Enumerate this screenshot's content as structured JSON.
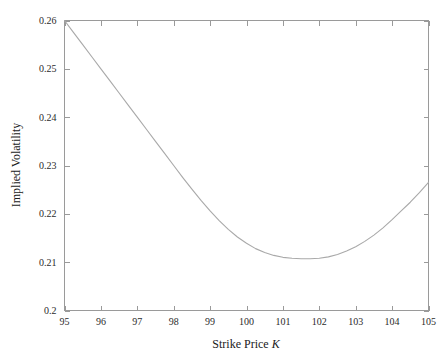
{
  "chart_data": {
    "type": "line",
    "title": "",
    "xlabel": "Strike Price K",
    "xlabel_plain": "Strike Price",
    "xlabel_symbol": "K",
    "ylabel": "Implied Volatility",
    "xlim": [
      95,
      105
    ],
    "ylim": [
      0.2,
      0.26
    ],
    "grid": false,
    "legend": null,
    "line_color": "#a9a9a9",
    "axis_color": "#9a9a9a",
    "text_color": "#2b2b2b",
    "background_color": "#ffffff",
    "xticks": [
      95,
      96,
      97,
      98,
      99,
      100,
      101,
      102,
      103,
      104,
      105
    ],
    "xtick_labels": [
      "95",
      "96",
      "97",
      "98",
      "99",
      "100",
      "101",
      "102",
      "103",
      "104",
      "105"
    ],
    "yticks": [
      0.2,
      0.21,
      0.22,
      0.23,
      0.24,
      0.25,
      0.26
    ],
    "ytick_labels": [
      "0.2",
      "0.21",
      "0.22",
      "0.23",
      "0.24",
      "0.25",
      "0.26"
    ],
    "minimum_point": {
      "x": 102.0,
      "y": 0.2108
    },
    "series": [
      {
        "name": "Implied Volatility Smile",
        "x": [
          95.0,
          95.25,
          95.5,
          95.75,
          96.0,
          96.25,
          96.5,
          96.75,
          97.0,
          97.25,
          97.5,
          97.75,
          98.0,
          98.25,
          98.5,
          98.75,
          99.0,
          99.25,
          99.5,
          99.75,
          100.0,
          100.25,
          100.5,
          100.75,
          101.0,
          101.25,
          101.5,
          101.75,
          102.0,
          102.25,
          102.5,
          102.75,
          103.0,
          103.25,
          103.5,
          103.75,
          104.0,
          104.25,
          104.5,
          104.75,
          105.0
        ],
        "y": [
          0.26,
          0.2575,
          0.255,
          0.2525,
          0.25,
          0.2475,
          0.245,
          0.2425,
          0.24,
          0.2375,
          0.235,
          0.2325,
          0.23,
          0.2275,
          0.2251,
          0.2228,
          0.2206,
          0.2186,
          0.2168,
          0.2152,
          0.2139,
          0.2128,
          0.212,
          0.2114,
          0.211,
          0.2108,
          0.2107,
          0.2107,
          0.2108,
          0.2111,
          0.2116,
          0.2123,
          0.2132,
          0.2143,
          0.2156,
          0.2171,
          0.2188,
          0.2206,
          0.2224,
          0.2244,
          0.2265
        ]
      }
    ]
  },
  "labels": {
    "y_axis_title": "Implied Volatility",
    "x_axis_title_plain": "Strike Price",
    "x_axis_title_symbol": "K"
  }
}
